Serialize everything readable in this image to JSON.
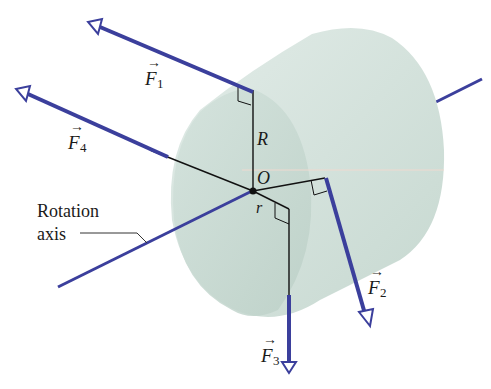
{
  "diagram": {
    "colors": {
      "force": "#3b3f9c",
      "cylinder_fill": "#d5e3dd",
      "cylinder_face": "#c9dad3",
      "line": "#111111"
    },
    "labels": {
      "F1": "F",
      "F1_sub": "1",
      "F2": "F",
      "F2_sub": "2",
      "F3": "F",
      "F3_sub": "3",
      "F4": "F",
      "F4_sub": "4",
      "R": "R",
      "O": "O",
      "r": "r",
      "rotation_axis_line1": "Rotation",
      "rotation_axis_line2": "axis"
    }
  }
}
